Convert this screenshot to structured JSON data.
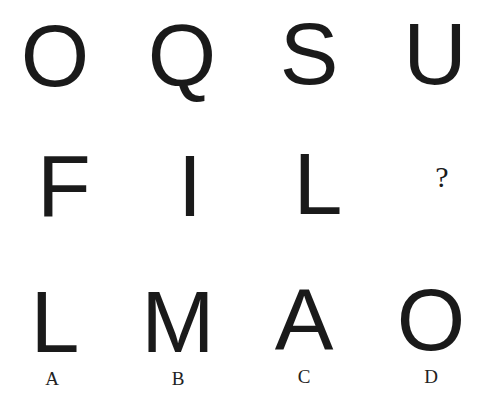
{
  "puzzle": {
    "row1": [
      "O",
      "Q",
      "S",
      "U"
    ],
    "row2": [
      "F",
      "I",
      "L",
      "?"
    ],
    "options": [
      {
        "letter": "L",
        "label": "A"
      },
      {
        "letter": "M",
        "label": "B"
      },
      {
        "letter": "A",
        "label": "C"
      },
      {
        "letter": "O",
        "label": "D"
      }
    ]
  }
}
